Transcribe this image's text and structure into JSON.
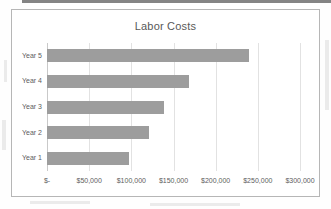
{
  "chart_data": {
    "type": "bar",
    "orientation": "horizontal",
    "title": "Labor Costs",
    "xlabel": "",
    "ylabel": "",
    "categories": [
      "Year 1",
      "Year 2",
      "Year 3",
      "Year 4",
      "Year 5"
    ],
    "values": [
      97000,
      121000,
      138500,
      168000,
      239000
    ],
    "value_labels": [
      "$97,000",
      "$121,000",
      "$138,500",
      "$168,000",
      "$239,000"
    ],
    "xlim": [
      0,
      300000
    ],
    "x_ticks": [
      0,
      50000,
      100000,
      150000,
      200000,
      250000,
      300000
    ],
    "x_tick_labels": [
      "$-",
      "$50,000",
      "$100,000",
      "$150,000",
      "$200,000",
      "$250,000",
      "$300,000"
    ],
    "y_tick_labels": [
      "Year 5",
      "Year 4",
      "Year 3",
      "Year 2",
      "Year 1"
    ],
    "grid": true,
    "gridlines": "vertical",
    "legend": false,
    "legend_position": "none",
    "series": [
      {
        "name": "Labor Costs",
        "color": "#9d9d9d",
        "values": [
          97000,
          121000,
          138500,
          168000,
          239000
        ]
      }
    ]
  },
  "colors": {
    "bar": "#9d9d9d",
    "gridline": "#e2e2e2",
    "axis": "#c9c9c9",
    "frame_border": "#b6b6b6",
    "title_text": "#585858",
    "tick_text": "#5d5d5d",
    "background": "#ffffff",
    "scan_band": "#6e6e6e"
  }
}
